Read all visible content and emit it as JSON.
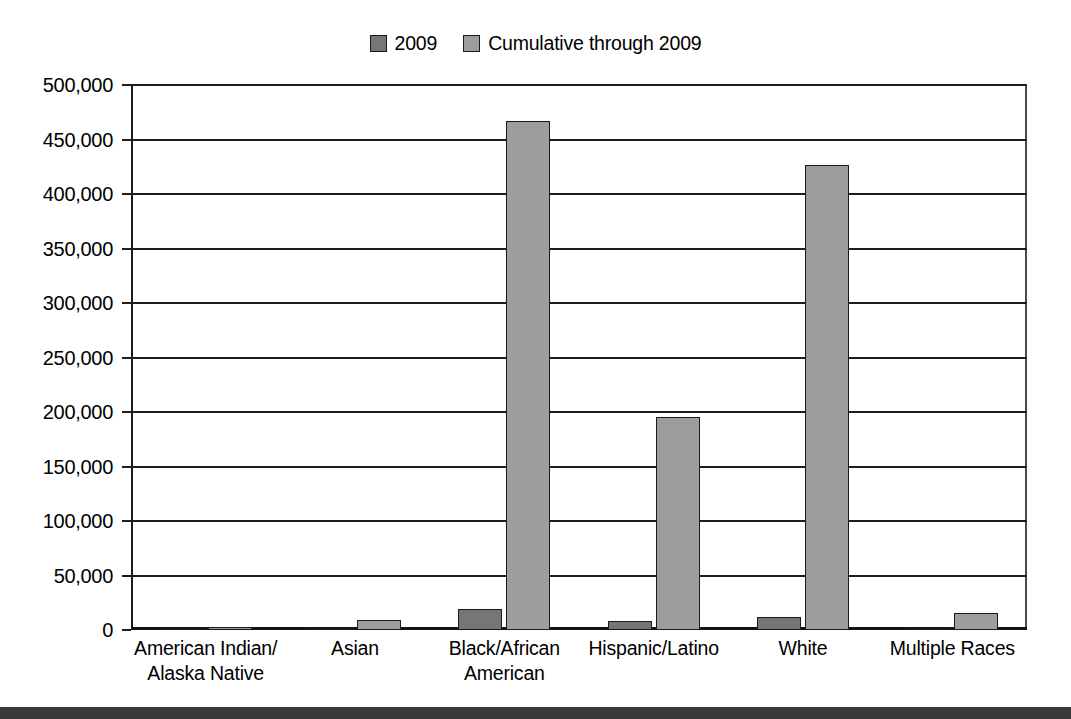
{
  "chart_data": {
    "type": "bar",
    "title": "",
    "subtitle": "",
    "xlabel": "",
    "ylabel": "",
    "ylim": [
      0,
      500000
    ],
    "ytick_step": 50000,
    "grid": true,
    "legend_position": "top-center",
    "categories": [
      "American Indian/\nAlaska Native",
      "Asian",
      "Black/African\nAmerican",
      "Hispanic/Latino",
      "White",
      "Multiple Races"
    ],
    "category_lines": [
      [
        "American Indian/",
        "Alaska Native"
      ],
      [
        "Asian",
        ""
      ],
      [
        "Black/African",
        "American"
      ],
      [
        "Hispanic/Latino",
        ""
      ],
      [
        "White",
        ""
      ],
      [
        "Multiple Races",
        ""
      ]
    ],
    "series": [
      {
        "name": "2009",
        "color": "#767676",
        "values": [
          1500,
          1000,
          19000,
          8500,
          12000,
          2000
        ]
      },
      {
        "name": "Cumulative through 2009",
        "color": "#9d9d9d",
        "values": [
          3000,
          9000,
          467000,
          195000,
          427000,
          16000
        ]
      }
    ],
    "ytick_labels": [
      "500,000",
      "450,000",
      "400,000",
      "350,000",
      "300,000",
      "250,000",
      "200,000",
      "150,000",
      "100,000",
      "50,000",
      "0"
    ],
    "ytick_values": [
      500000,
      450000,
      400000,
      350000,
      300000,
      250000,
      200000,
      150000,
      100000,
      50000,
      0
    ]
  },
  "legend": {
    "entries": [
      {
        "label": "2009",
        "color": "#767676"
      },
      {
        "label": "Cumulative through 2009",
        "color": "#9d9d9d"
      }
    ]
  },
  "colors": {
    "series_2009": "#767676",
    "series_cumulative": "#9d9d9d",
    "axis": "#1d1d1d",
    "footer_band": "#3a3a3a",
    "background": "#ffffff"
  }
}
